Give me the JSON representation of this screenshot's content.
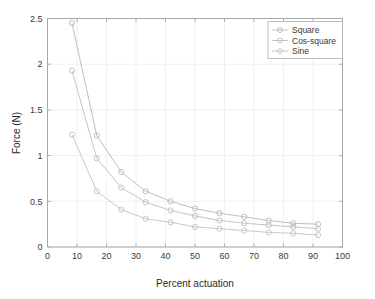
{
  "chart_data": {
    "type": "line",
    "title": "",
    "xlabel": "Percent actuation",
    "ylabel": "Force (N)",
    "xlim": [
      0,
      100
    ],
    "ylim": [
      0,
      2.5
    ],
    "xticks": [
      0,
      10,
      20,
      30,
      40,
      50,
      60,
      70,
      80,
      90,
      100
    ],
    "yticks": [
      0,
      0.5,
      1,
      1.5,
      2,
      2.5
    ],
    "xtick_labels": [
      "0",
      "10",
      "20",
      "30",
      "40",
      "50",
      "60",
      "70",
      "80",
      "90",
      "100"
    ],
    "ytick_labels": [
      "0",
      "0.5",
      "1",
      "1.5",
      "2",
      "2.5"
    ],
    "grid": true,
    "legend_position": "upper-right",
    "marker": "circle",
    "x": [
      8.3,
      16.7,
      25.0,
      33.3,
      41.7,
      50.0,
      58.3,
      66.7,
      75.0,
      83.3,
      91.7
    ],
    "series": [
      {
        "name": "Square",
        "color": "#b8b8b8",
        "values": [
          2.45,
          1.22,
          0.82,
          0.61,
          0.5,
          0.42,
          0.37,
          0.33,
          0.29,
          0.26,
          0.25
        ]
      },
      {
        "name": "Cos-square",
        "color": "#bdbdbd",
        "values": [
          1.93,
          0.97,
          0.65,
          0.49,
          0.4,
          0.34,
          0.29,
          0.26,
          0.24,
          0.22,
          0.2
        ]
      },
      {
        "name": "Sine",
        "color": "#c2c2c2",
        "values": [
          1.23,
          0.61,
          0.41,
          0.31,
          0.27,
          0.22,
          0.2,
          0.18,
          0.16,
          0.15,
          0.13
        ]
      }
    ]
  },
  "legend": {
    "entries": [
      {
        "label": "Square"
      },
      {
        "label": "Cos-square"
      },
      {
        "label": "Sine"
      }
    ]
  },
  "axes": {
    "x_title": "Percent actuation",
    "y_title": "Force (N)"
  }
}
